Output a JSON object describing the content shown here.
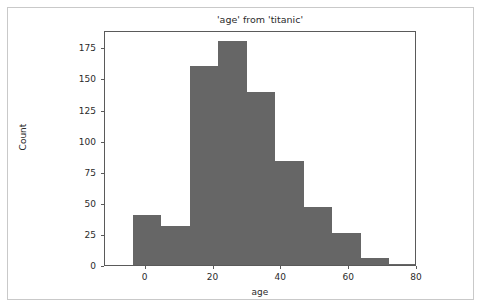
{
  "chart_data": {
    "type": "bar",
    "title": "'age' from 'titanic'",
    "xlabel": "age",
    "ylabel": "Count",
    "grid": false,
    "legend": null,
    "legend_position": "none",
    "bar_color": "#666666",
    "axes_color": "#5a5a5a",
    "background_color": "#ffffff",
    "figure_border_color": "#c9c9c9",
    "bin_edges": [
      -3.8,
      4.6,
      13.0,
      21.4,
      29.8,
      38.2,
      46.6,
      55.0,
      63.4,
      71.8,
      80.2
    ],
    "categories": [
      "-3.8 to 4.6",
      "4.6 to 13.0",
      "13.0 to 21.4",
      "21.4 to 29.8",
      "29.8 to 38.2",
      "38.2 to 46.6",
      "46.6 to 55.0",
      "55.0 to 63.4",
      "63.4 to 71.8",
      "71.8 to 80.2"
    ],
    "values": [
      40,
      31,
      160,
      180,
      139,
      84,
      47,
      26,
      6,
      1
    ],
    "xlim": [
      -12.0,
      80.0
    ],
    "ylim": [
      0,
      189
    ],
    "xticks": [
      0,
      20,
      40,
      60,
      80
    ],
    "xticklabels": [
      "0",
      "20",
      "40",
      "60",
      "80"
    ],
    "yticks": [
      0,
      25,
      50,
      75,
      100,
      125,
      150,
      175
    ],
    "yticklabels": [
      "0",
      "25",
      "50",
      "75",
      "100",
      "125",
      "150",
      "175"
    ]
  }
}
